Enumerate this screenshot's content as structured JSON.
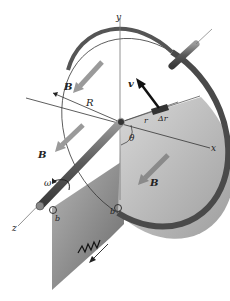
{
  "diagram": {
    "labels": {
      "y_axis": "y",
      "x_axis": "x",
      "z_axis": "z",
      "radius": "R",
      "velocity": "v",
      "r": "r",
      "delta_r": "Δr",
      "theta": "θ",
      "omega": "ω",
      "b_left": "b",
      "b_right": "b",
      "B_upper_left": "B",
      "B_left": "B",
      "B_lower_right": "B"
    },
    "colors": {
      "disk_face": "#c8c8c8",
      "disk_rim": "#555555",
      "field_arrow": "#9a9a9a",
      "velocity_arrow": "#1a1a1a",
      "circuit_sheet": "#8f8f8f",
      "axle": "#6f6f6f",
      "lines": "#333333"
    }
  }
}
